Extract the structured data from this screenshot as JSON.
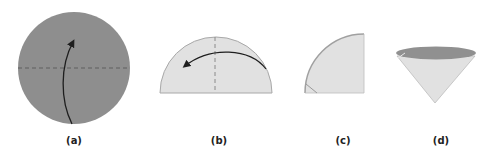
{
  "figure": {
    "panels": [
      {
        "id": "a",
        "label": "(a)",
        "shape": "circle",
        "description": "Full circle with horizontal dashed fold line and upward fold arrow"
      },
      {
        "id": "b",
        "label": "(b)",
        "shape": "semicircle",
        "description": "Semicircle with vertical dashed fold line and leftward fold arrow"
      },
      {
        "id": "c",
        "label": "(c)",
        "shape": "quarter-circle",
        "description": "Quarter circle folded paper"
      },
      {
        "id": "d",
        "label": "(d)",
        "shape": "cone",
        "description": "Paper opened into a cone"
      }
    ],
    "colors": {
      "circle_fill": "#8e8e8e",
      "paper_fill": "#e1e1e1",
      "cone_top_fill": "#909090",
      "edge": "#a8a8a8",
      "dash": "#5e5e5e",
      "arrow": "#1e1e1e",
      "label": "#222222"
    }
  }
}
